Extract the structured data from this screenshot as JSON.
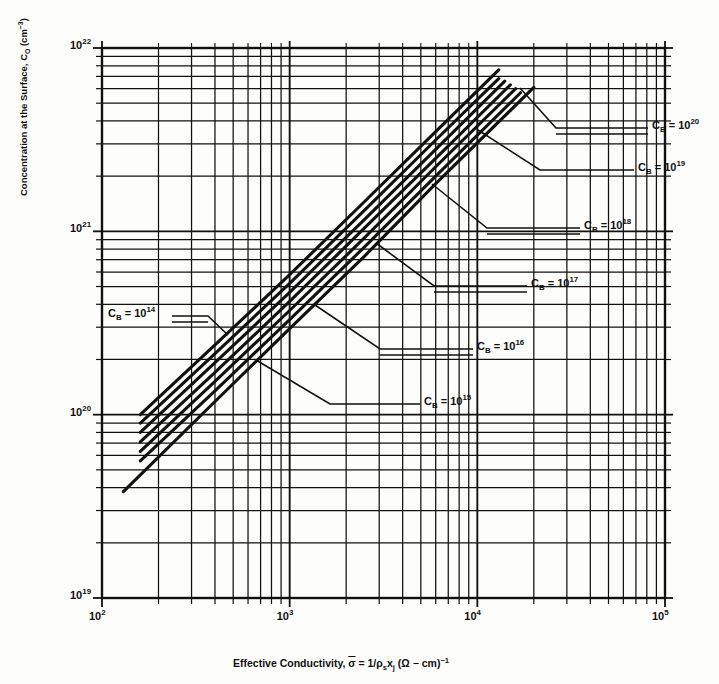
{
  "chart_data": {
    "type": "line",
    "title": "",
    "xlabel": "Effective Conductivity, σ̄ = 1/ρₛxⱼ (Ω − cm)⁻¹",
    "ylabel": "Concentration at the Surface, Cₒ (cm⁻³)",
    "xscale": "log",
    "yscale": "log",
    "xlim": [
      100,
      100000
    ],
    "ylim": [
      1e+19,
      1e+22
    ],
    "grid": "log-minor-both",
    "legend_position": "inline-annotations",
    "xticks": [
      "10^2",
      "10^3",
      "10^4",
      "10^5"
    ],
    "xtick_values": [
      100,
      1000,
      10000,
      100000
    ],
    "yticks": [
      "10^19",
      "10^20",
      "10^21",
      "10^22"
    ],
    "ytick_values": [
      1e+19,
      1e+20,
      1e+21,
      1e+22
    ],
    "series": [
      {
        "name": "C_B = 10^14",
        "label": "Cₑ = 10¹⁴",
        "cb": 100000000000000.0,
        "x": [
          160,
          400,
          1000,
          2500,
          6000,
          13000
        ],
        "y": [
          1e+20,
          2.4e+20,
          5.8e+20,
          1.45e+21,
          3.5e+21,
          7.6e+21
        ]
      },
      {
        "name": "C_B = 10^15",
        "label": "Cₑ = 10¹⁵",
        "cb": 1000000000000000.0,
        "x": [
          160,
          400,
          1000,
          2500,
          6000,
          13000
        ],
        "y": [
          9e+19,
          2.15e+20,
          5.2e+20,
          1.3e+21,
          3.15e+21,
          6.8e+21
        ]
      },
      {
        "name": "C_B = 10^16",
        "label": "Cₑ = 10¹⁶",
        "cb": 1e+16,
        "x": [
          160,
          400,
          1000,
          2500,
          6000,
          14000
        ],
        "y": [
          8e+19,
          1.92e+20,
          4.65e+20,
          1.16e+21,
          2.8e+21,
          6.6e+21
        ]
      },
      {
        "name": "C_B = 10^17",
        "label": "Cₑ = 10¹⁷",
        "cb": 1e+17,
        "x": [
          160,
          400,
          1000,
          2500,
          6000,
          15000
        ],
        "y": [
          7.1e+19,
          1.7e+20,
          4.15e+20,
          1.04e+21,
          2.5e+21,
          6.3e+21
        ]
      },
      {
        "name": "C_B = 10^18",
        "label": "Cₑ = 10¹⁸",
        "cb": 1e+18,
        "x": [
          160,
          400,
          1000,
          2500,
          6000,
          16000
        ],
        "y": [
          6.3e+19,
          1.52e+20,
          3.7e+20,
          9.2e+20,
          2.25e+21,
          6e+21
        ]
      },
      {
        "name": "C_B = 10^19",
        "label": "Cₑ = 10¹⁹",
        "cb": 1e+19,
        "x": [
          160,
          400,
          1000,
          2500,
          6000,
          17000
        ],
        "y": [
          5.6e+19,
          1.35e+20,
          3.3e+20,
          8.2e+20,
          2e+21,
          5.7e+21
        ]
      },
      {
        "name": "C_B = 10^20",
        "label": "Cₑ = 10²⁰",
        "cb": 1e+20,
        "x": [
          130,
          400,
          1000,
          2500,
          6000,
          20000
        ],
        "y": [
          3.8e+19,
          1.18e+20,
          2.95e+20,
          7.3e+20,
          1.82e+21,
          6.1e+21
        ]
      }
    ],
    "annotations": [
      {
        "text": "C_B = 10^14",
        "x_px": 116,
        "y_px": 318
      },
      {
        "text": "C_B = 10^15",
        "x_px": 333,
        "y_px": 393
      },
      {
        "text": "C_B = 10^16",
        "x_px": 385,
        "y_px": 339
      },
      {
        "text": "C_B = 10^17",
        "x_px": 438,
        "y_px": 276
      },
      {
        "text": "C_B = 10^18",
        "x_px": 492,
        "y_px": 218
      },
      {
        "text": "C_B = 10^19",
        "x_px": 546,
        "y_px": 161
      },
      {
        "text": "C_B = 10^20",
        "x_px": 561,
        "y_px": 120
      }
    ]
  },
  "axes": {
    "x_title_parts": {
      "prefix": "Effective Conductivity, ",
      "sigma": "σ",
      "eq": " = 1/",
      "rho": "ρ",
      "rho_sub": "s",
      "x": "x",
      "x_sub": "j",
      "units_open": " (",
      "omega": "Ω",
      "dash": " − cm)",
      "exp": "−1"
    },
    "y_title_parts": {
      "prefix": "Concentration at the Surface, C",
      "sub": "O",
      "units": " (cm",
      "units_exp": "−3",
      "close": ")"
    }
  },
  "xtick_labels": [
    {
      "mant": "10",
      "exp": "2"
    },
    {
      "mant": "10",
      "exp": "3"
    },
    {
      "mant": "10",
      "exp": "4"
    },
    {
      "mant": "10",
      "exp": "5"
    }
  ],
  "ytick_labels": [
    {
      "mant": "10",
      "exp": "22"
    },
    {
      "mant": "10",
      "exp": "21"
    },
    {
      "mant": "10",
      "exp": "20"
    },
    {
      "mant": "10",
      "exp": "19"
    }
  ],
  "curve_labels": [
    {
      "cb": "C",
      "sub": "B",
      "eq": " = 10",
      "exp": "20"
    },
    {
      "cb": "C",
      "sub": "B",
      "eq": " = 10",
      "exp": "19"
    },
    {
      "cb": "C",
      "sub": "B",
      "eq": " = 10",
      "exp": "18"
    },
    {
      "cb": "C",
      "sub": "B",
      "eq": " = 10",
      "exp": "17"
    },
    {
      "cb": "C",
      "sub": "B",
      "eq": " = 10",
      "exp": "16"
    },
    {
      "cb": "C",
      "sub": "B",
      "eq": " = 10",
      "exp": "15"
    },
    {
      "cb": "C",
      "sub": "B",
      "eq": " = 10",
      "exp": "14"
    }
  ]
}
